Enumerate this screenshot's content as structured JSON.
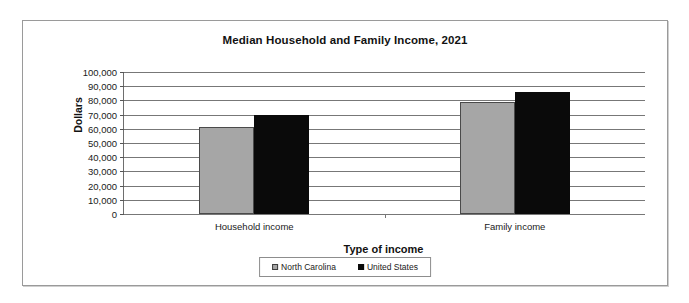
{
  "chart_data": {
    "type": "bar",
    "title": "Median Household and Family Income, 2021",
    "xlabel": "Type of income",
    "ylabel": "Dollars",
    "categories": [
      "Household income",
      "Family income"
    ],
    "series": [
      {
        "name": "North Carolina",
        "color": "#a6a6a6",
        "values": [
          61000,
          79000
        ]
      },
      {
        "name": "United States",
        "color": "#0a0a0a",
        "values": [
          70000,
          86000
        ]
      }
    ],
    "ylim": [
      0,
      100000
    ],
    "ytick_step": 10000,
    "ytick_labels": [
      "100,000",
      "90,000",
      "80,000",
      "70,000",
      "60,000",
      "50,000",
      "40,000",
      "30,000",
      "20,000",
      "10,000",
      "0"
    ],
    "grid": true,
    "legend_position": "bottom"
  }
}
